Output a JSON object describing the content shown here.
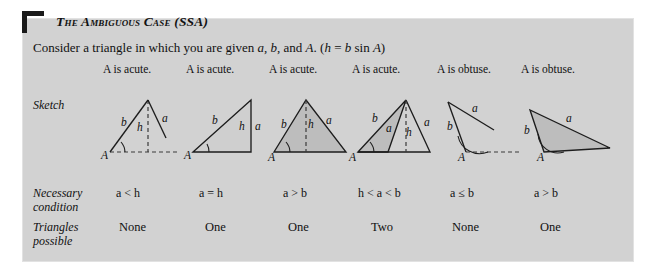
{
  "panel": {
    "title": "The Ambiguous Case (SSA)",
    "subtitle_parts": {
      "lead": "Consider a triangle in which you are given ",
      "var_a": "a",
      "comma1": ", ",
      "var_b": "b",
      "mid": ", and ",
      "var_A": "A",
      "formula_open": ". (",
      "var_h": "h",
      "equals": " = ",
      "var_b2": "b",
      "sin": " sin ",
      "var_A2": "A",
      "formula_close": ")"
    },
    "background_color": "#d2d2d2",
    "accent_color": "#1a1a1a"
  },
  "rows": {
    "sketch_label": "Sketch",
    "necessary_label_line1": "Necessary",
    "necessary_label_line2": "condition",
    "triangles_label_line1": "Triangles",
    "triangles_label_line2": "possible"
  },
  "cases": [
    {
      "id": "case-1",
      "heading": "A is acute.",
      "condition": "a < h",
      "triangles_possible": "None",
      "labels": {
        "A": "A",
        "b": "b",
        "h": "h",
        "a": "a"
      }
    },
    {
      "id": "case-2",
      "heading": "A is acute.",
      "condition": "a = h",
      "triangles_possible": "One",
      "labels": {
        "A": "A",
        "b": "b",
        "h": "h",
        "a": "a"
      }
    },
    {
      "id": "case-3",
      "heading": "A is acute.",
      "condition": "a > b",
      "triangles_possible": "One",
      "labels": {
        "A": "A",
        "b": "b",
        "h": "h",
        "a": "a"
      }
    },
    {
      "id": "case-4",
      "heading": "A is acute.",
      "condition": "h < a < b",
      "triangles_possible": "Two",
      "labels": {
        "A": "A",
        "b": "b",
        "h": "h",
        "a1": "a",
        "a2": "a"
      }
    },
    {
      "id": "case-5",
      "heading": "A is obtuse.",
      "condition": "a ≤ b",
      "triangles_possible": "None",
      "labels": {
        "A": "A",
        "b": "b",
        "a": "a"
      }
    },
    {
      "id": "case-6",
      "heading": "A is obtuse.",
      "condition": "a > b",
      "triangles_possible": "One",
      "labels": {
        "A": "A",
        "b": "b",
        "a": "a"
      }
    }
  ]
}
